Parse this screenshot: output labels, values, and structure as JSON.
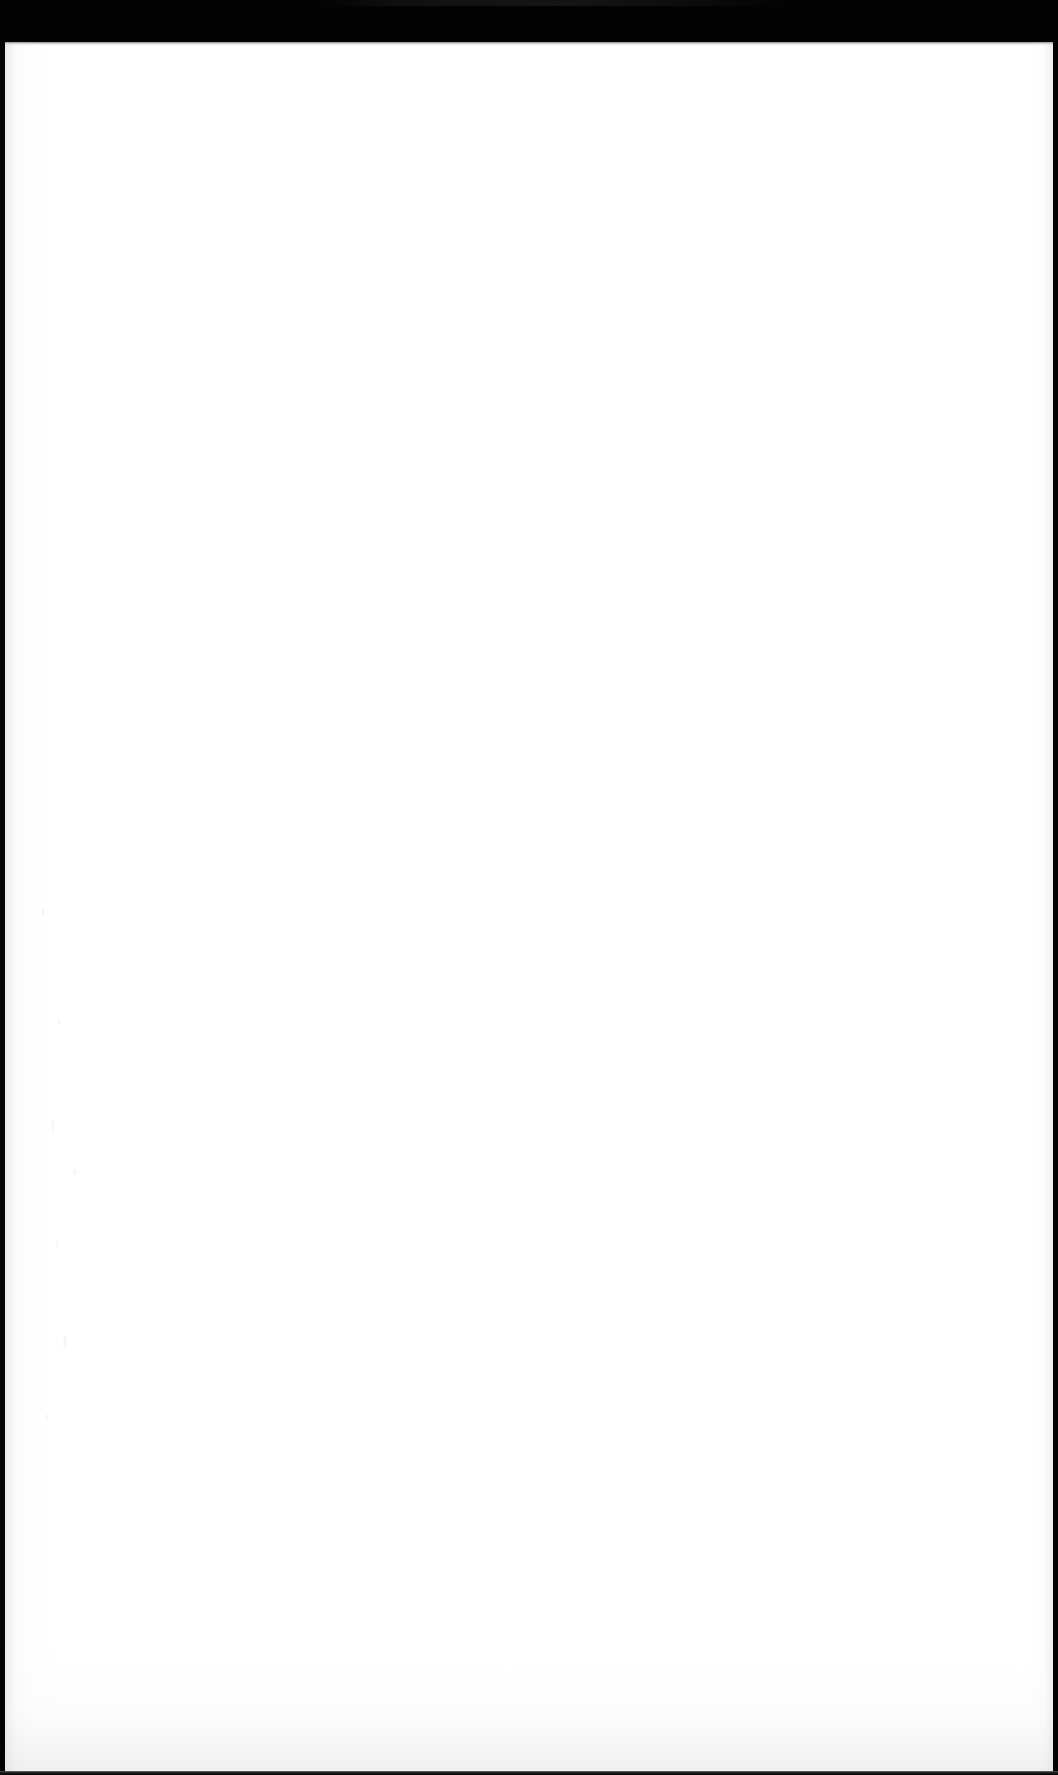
{
  "document": {
    "page_label": "",
    "body_text": "",
    "description": "Blank scanned page"
  },
  "scan": {
    "top_band_label": "",
    "bottom_bar_label": "",
    "left_edge_label": "",
    "right_edge_label": ""
  },
  "colors": {
    "scanner_backdrop": "#030303",
    "paper": "#ffffff",
    "bottom_bar": "#1a1a1c",
    "edge_shadow": "#c9c9ce"
  },
  "geometry": {
    "width": 1058,
    "height": 1775,
    "top_band_height": 42,
    "paper_top": 42,
    "paper_left": 5,
    "paper_width": 1048,
    "paper_height": 1730
  }
}
